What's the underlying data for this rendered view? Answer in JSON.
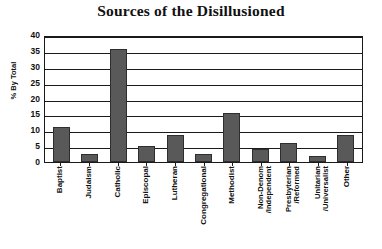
{
  "chart_data": {
    "type": "bar",
    "title": "Sources of the Disillusioned",
    "xlabel": "",
    "ylabel": "% By Total",
    "ylim": [
      0,
      40
    ],
    "yticks": [
      0,
      5,
      10,
      15,
      20,
      25,
      30,
      35,
      40
    ],
    "grid": true,
    "legend": false,
    "categories": [
      "Baptist",
      "Judaism",
      "Catholic",
      "Episcopal",
      "Lutheran",
      "Congregational",
      "Methodist",
      "Non-Denom\n/Independent",
      "Presbyterian\n/Reformed",
      "Unitarian\n/Universalist",
      "Other"
    ],
    "values": [
      11,
      2.5,
      35.5,
      5,
      8.5,
      2.5,
      15.5,
      4,
      6,
      2,
      8.5
    ],
    "bar_color": "#595959",
    "bar_edge_color": "#2e2e2e",
    "axis_color": "#1a1a1a",
    "background_color": "#ffffff"
  }
}
